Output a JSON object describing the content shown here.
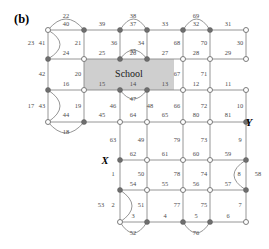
{
  "figure": {
    "panel_label": "(b)",
    "region_label": "School",
    "terminal_labels": [
      {
        "name": "X",
        "x": 105,
        "y": 160
      },
      {
        "name": "Y",
        "x": 249,
        "y": 122
      }
    ],
    "colors": {
      "edge": "#8a8a8a",
      "node_filled": "#6e6e6e",
      "node_hollow": "#ffffff",
      "school_fill": "#cfcfcf",
      "label_text": "#4a4a4a",
      "background": "#ffffff"
    },
    "school_region": {
      "x": 84,
      "y": 59,
      "width": 90,
      "height": 31
    }
  },
  "chart_data": {
    "type": "diagram",
    "title": "(b)",
    "nodes": [
      {
        "id": "n1",
        "x": 48,
        "y": 30,
        "style": "hollow"
      },
      {
        "id": "n2",
        "x": 84,
        "y": 30,
        "style": "filled"
      },
      {
        "id": "n3",
        "x": 120,
        "y": 30,
        "style": "filled"
      },
      {
        "id": "n4",
        "x": 147,
        "y": 30,
        "style": "filled"
      },
      {
        "id": "n5",
        "x": 183,
        "y": 30,
        "style": "filled"
      },
      {
        "id": "n6",
        "x": 210,
        "y": 30,
        "style": "filled"
      },
      {
        "id": "n7",
        "x": 246,
        "y": 30,
        "style": "hollow"
      },
      {
        "id": "n8",
        "x": 48,
        "y": 59,
        "style": "filled"
      },
      {
        "id": "n9",
        "x": 84,
        "y": 59,
        "style": "hollow"
      },
      {
        "id": "n10",
        "x": 120,
        "y": 59,
        "style": "filled"
      },
      {
        "id": "n11",
        "x": 147,
        "y": 59,
        "style": "filled"
      },
      {
        "id": "n12",
        "x": 183,
        "y": 59,
        "style": "hollow"
      },
      {
        "id": "n13",
        "x": 210,
        "y": 59,
        "style": "hollow"
      },
      {
        "id": "n14",
        "x": 246,
        "y": 59,
        "style": "hollow"
      },
      {
        "id": "n15",
        "x": 48,
        "y": 90,
        "style": "filled"
      },
      {
        "id": "n16",
        "x": 84,
        "y": 90,
        "style": "hollow"
      },
      {
        "id": "n17",
        "x": 120,
        "y": 90,
        "style": "filled"
      },
      {
        "id": "n18",
        "x": 147,
        "y": 90,
        "style": "filled"
      },
      {
        "id": "n19",
        "x": 183,
        "y": 90,
        "style": "hollow"
      },
      {
        "id": "n20",
        "x": 210,
        "y": 90,
        "style": "hollow"
      },
      {
        "id": "n21",
        "x": 246,
        "y": 90,
        "style": "hollow"
      },
      {
        "id": "n22",
        "x": 48,
        "y": 122,
        "style": "hollow"
      },
      {
        "id": "n23",
        "x": 84,
        "y": 122,
        "style": "filled"
      },
      {
        "id": "n24",
        "x": 120,
        "y": 122,
        "style": "hollow"
      },
      {
        "id": "n25",
        "x": 147,
        "y": 122,
        "style": "hollow"
      },
      {
        "id": "n26",
        "x": 183,
        "y": 122,
        "style": "hollow"
      },
      {
        "id": "n27",
        "x": 210,
        "y": 122,
        "style": "hollow"
      },
      {
        "id": "n28",
        "x": 246,
        "y": 122,
        "style": "filled"
      },
      {
        "id": "n29",
        "x": 120,
        "y": 160,
        "style": "filled"
      },
      {
        "id": "n30",
        "x": 147,
        "y": 160,
        "style": "hollow"
      },
      {
        "id": "n31",
        "x": 183,
        "y": 160,
        "style": "hollow"
      },
      {
        "id": "n32",
        "x": 210,
        "y": 160,
        "style": "hollow"
      },
      {
        "id": "n33",
        "x": 246,
        "y": 160,
        "style": "filled"
      },
      {
        "id": "n34",
        "x": 120,
        "y": 190,
        "style": "filled"
      },
      {
        "id": "n35",
        "x": 147,
        "y": 190,
        "style": "hollow"
      },
      {
        "id": "n36",
        "x": 183,
        "y": 190,
        "style": "hollow"
      },
      {
        "id": "n37",
        "x": 210,
        "y": 190,
        "style": "hollow"
      },
      {
        "id": "n38",
        "x": 246,
        "y": 190,
        "style": "filled"
      },
      {
        "id": "n39",
        "x": 120,
        "y": 222,
        "style": "hollow"
      },
      {
        "id": "n40",
        "x": 147,
        "y": 222,
        "style": "filled"
      },
      {
        "id": "n41",
        "x": 183,
        "y": 222,
        "style": "filled"
      },
      {
        "id": "n42",
        "x": 210,
        "y": 222,
        "style": "filled"
      },
      {
        "id": "n43",
        "x": 246,
        "y": 222,
        "style": "hollow"
      }
    ],
    "edges": [
      {
        "label": "22",
        "type": "arc",
        "from": "n1",
        "to": "n2",
        "lx": 66,
        "ly": 17,
        "bulge": -11
      },
      {
        "label": "40",
        "type": "line",
        "from": "n1",
        "to": "n2",
        "lx": 66,
        "ly": 25
      },
      {
        "label": "23",
        "type": "arc",
        "from": "n1",
        "to": "n8",
        "lx": 31,
        "ly": 44,
        "bulge": -12
      },
      {
        "label": "41",
        "type": "line",
        "from": "n1",
        "to": "n8",
        "lx": 42,
        "ly": 44
      },
      {
        "label": "21",
        "type": "line",
        "from": "n2",
        "to": "n9",
        "lx": 78,
        "ly": 44
      },
      {
        "label": "39",
        "type": "line",
        "from": "n2",
        "to": "n3",
        "lx": 102,
        "ly": 25
      },
      {
        "label": "36",
        "type": "line",
        "from": "n3",
        "to": "n10",
        "lx": 114,
        "ly": 44
      },
      {
        "label": "38",
        "type": "arc",
        "from": "n3",
        "to": "n4",
        "lx": 133,
        "ly": 17,
        "bulge": -11
      },
      {
        "label": "37",
        "type": "line",
        "from": "n3",
        "to": "n4",
        "lx": 133,
        "ly": 25
      },
      {
        "label": "34",
        "type": "line",
        "from": "n4",
        "to": "n11",
        "lx": 141,
        "ly": 44
      },
      {
        "label": "35",
        "type": "arc",
        "from": "n10",
        "to": "n11",
        "lx": 133,
        "ly": 52,
        "bulge": -9
      },
      {
        "label": "33",
        "type": "line",
        "from": "n4",
        "to": "n5",
        "lx": 165,
        "ly": 25
      },
      {
        "label": "69",
        "type": "arc",
        "from": "n5",
        "to": "n6",
        "lx": 196,
        "ly": 17,
        "bulge": -11
      },
      {
        "label": "32",
        "type": "line",
        "from": "n5",
        "to": "n6",
        "lx": 196,
        "ly": 25
      },
      {
        "label": "68",
        "type": "line",
        "from": "n5",
        "to": "n12",
        "lx": 177,
        "ly": 44
      },
      {
        "label": "70",
        "type": "line",
        "from": "n6",
        "to": "n13",
        "lx": 204,
        "ly": 44
      },
      {
        "label": "31",
        "type": "line",
        "from": "n6",
        "to": "n7",
        "lx": 228,
        "ly": 25
      },
      {
        "label": "30",
        "type": "line",
        "from": "n7",
        "to": "n14",
        "lx": 240,
        "ly": 44
      },
      {
        "label": "24",
        "type": "line",
        "from": "n8",
        "to": "n9",
        "lx": 66,
        "ly": 54
      },
      {
        "label": "42",
        "type": "line",
        "from": "n8",
        "to": "n15",
        "lx": 42,
        "ly": 75
      },
      {
        "label": "20",
        "type": "line",
        "from": "n9",
        "to": "n16",
        "lx": 78,
        "ly": 75
      },
      {
        "label": "25",
        "type": "line",
        "from": "n9",
        "to": "n10",
        "lx": 102,
        "ly": 54
      },
      {
        "label": "26",
        "type": "line",
        "from": "n10",
        "to": "n11",
        "lx": 133,
        "ly": 54
      },
      {
        "label": "27",
        "type": "line",
        "from": "n11",
        "to": "n12",
        "lx": 165,
        "ly": 54
      },
      {
        "label": "67",
        "type": "line",
        "from": "n12",
        "to": "n19",
        "lx": 177,
        "ly": 75
      },
      {
        "label": "28",
        "type": "line",
        "from": "n12",
        "to": "n13",
        "lx": 196,
        "ly": 54
      },
      {
        "label": "71",
        "type": "line",
        "from": "n13",
        "to": "n20",
        "lx": 204,
        "ly": 75
      },
      {
        "label": "29",
        "type": "line",
        "from": "n13",
        "to": "n14",
        "lx": 228,
        "ly": 54
      },
      {
        "label": "16",
        "type": "line",
        "from": "n15",
        "to": "n16",
        "lx": 66,
        "ly": 85
      },
      {
        "label": "17",
        "type": "arc",
        "from": "n15",
        "to": "n22",
        "lx": 31,
        "ly": 107,
        "bulge": -12
      },
      {
        "label": "43",
        "type": "line",
        "from": "n15",
        "to": "n22",
        "lx": 42,
        "ly": 107
      },
      {
        "label": "19",
        "type": "line",
        "from": "n16",
        "to": "n23",
        "lx": 78,
        "ly": 107
      },
      {
        "label": "15",
        "type": "line",
        "from": "n16",
        "to": "n17",
        "lx": 102,
        "ly": 85
      },
      {
        "label": "14",
        "type": "line",
        "from": "n17",
        "to": "n18",
        "lx": 133,
        "ly": 85
      },
      {
        "label": "47",
        "type": "arc",
        "from": "n17",
        "to": "n18",
        "lx": 133,
        "ly": 100,
        "bulge": 9
      },
      {
        "label": "46",
        "type": "line",
        "from": "n17",
        "to": "n24",
        "lx": 113,
        "ly": 107
      },
      {
        "label": "48",
        "type": "line",
        "from": "n18",
        "to": "n25",
        "lx": 150,
        "ly": 107
      },
      {
        "label": "13",
        "type": "line",
        "from": "n18",
        "to": "n19",
        "lx": 165,
        "ly": 85
      },
      {
        "label": "66",
        "type": "line",
        "from": "n19",
        "to": "n26",
        "lx": 177,
        "ly": 107
      },
      {
        "label": "12",
        "type": "line",
        "from": "n19",
        "to": "n20",
        "lx": 196,
        "ly": 85
      },
      {
        "label": "72",
        "type": "line",
        "from": "n20",
        "to": "n27",
        "lx": 204,
        "ly": 107
      },
      {
        "label": "11",
        "type": "line",
        "from": "n20",
        "to": "n21",
        "lx": 228,
        "ly": 85
      },
      {
        "label": "10",
        "type": "line",
        "from": "n21",
        "to": "n28",
        "lx": 240,
        "ly": 107
      },
      {
        "label": "44",
        "type": "line",
        "from": "n22",
        "to": "n23",
        "lx": 66,
        "ly": 116
      },
      {
        "label": "18",
        "type": "arc",
        "from": "n22",
        "to": "n23",
        "lx": 66,
        "ly": 133,
        "bulge": 11
      },
      {
        "label": "45",
        "type": "line",
        "from": "n23",
        "to": "n24",
        "lx": 102,
        "ly": 116
      },
      {
        "label": "63",
        "type": "line",
        "from": "n24",
        "to": "n29",
        "lx": 113,
        "ly": 141
      },
      {
        "label": "64",
        "type": "line",
        "from": "n24",
        "to": "n25",
        "lx": 133,
        "ly": 116
      },
      {
        "label": "49",
        "type": "line",
        "from": "n25",
        "to": "n30",
        "lx": 141,
        "ly": 141
      },
      {
        "label": "65",
        "type": "line",
        "from": "n25",
        "to": "n26",
        "lx": 165,
        "ly": 116
      },
      {
        "label": "79",
        "type": "line",
        "from": "n26",
        "to": "n31",
        "lx": 177,
        "ly": 141
      },
      {
        "label": "80",
        "type": "line",
        "from": "n26",
        "to": "n27",
        "lx": 196,
        "ly": 116
      },
      {
        "label": "73",
        "type": "line",
        "from": "n27",
        "to": "n32",
        "lx": 204,
        "ly": 141
      },
      {
        "label": "81",
        "type": "line",
        "from": "n27",
        "to": "n28",
        "lx": 228,
        "ly": 116
      },
      {
        "label": "9",
        "type": "line",
        "from": "n28",
        "to": "n33",
        "lx": 240,
        "ly": 141
      },
      {
        "label": "62",
        "type": "line",
        "from": "n29",
        "to": "n30",
        "lx": 133,
        "ly": 155
      },
      {
        "label": "1",
        "type": "line",
        "from": "n29",
        "to": "n34",
        "lx": 113,
        "ly": 175
      },
      {
        "label": "50",
        "type": "line",
        "from": "n30",
        "to": "n35",
        "lx": 141,
        "ly": 175
      },
      {
        "label": "61",
        "type": "line",
        "from": "n30",
        "to": "n31",
        "lx": 165,
        "ly": 155
      },
      {
        "label": "78",
        "type": "line",
        "from": "n31",
        "to": "n36",
        "lx": 177,
        "ly": 175
      },
      {
        "label": "60",
        "type": "line",
        "from": "n31",
        "to": "n32",
        "lx": 196,
        "ly": 155
      },
      {
        "label": "74",
        "type": "line",
        "from": "n32",
        "to": "n37",
        "lx": 204,
        "ly": 175
      },
      {
        "label": "59",
        "type": "line",
        "from": "n32",
        "to": "n33",
        "lx": 228,
        "ly": 155
      },
      {
        "label": "58",
        "type": "arc",
        "from": "n33",
        "to": "n38",
        "lx": 258,
        "ly": 175,
        "bulge": 12
      },
      {
        "label": "8",
        "type": "line",
        "from": "n33",
        "to": "n38",
        "lx": 239,
        "ly": 175
      },
      {
        "label": "54",
        "type": "line",
        "from": "n34",
        "to": "n35",
        "lx": 133,
        "ly": 185
      },
      {
        "label": "2",
        "type": "line",
        "from": "n34",
        "to": "n39",
        "lx": 113,
        "ly": 206
      },
      {
        "label": "53",
        "type": "arc",
        "from": "n34",
        "to": "n39",
        "lx": 101,
        "ly": 206,
        "bulge": -12
      },
      {
        "label": "51",
        "type": "line",
        "from": "n35",
        "to": "n40",
        "lx": 141,
        "ly": 206
      },
      {
        "label": "55",
        "type": "line",
        "from": "n35",
        "to": "n36",
        "lx": 165,
        "ly": 185
      },
      {
        "label": "77",
        "type": "line",
        "from": "n36",
        "to": "n41",
        "lx": 177,
        "ly": 206
      },
      {
        "label": "56",
        "type": "line",
        "from": "n36",
        "to": "n37",
        "lx": 196,
        "ly": 185
      },
      {
        "label": "75",
        "type": "line",
        "from": "n37",
        "to": "n42",
        "lx": 204,
        "ly": 206
      },
      {
        "label": "57",
        "type": "line",
        "from": "n37",
        "to": "n38",
        "lx": 228,
        "ly": 185
      },
      {
        "label": "7",
        "type": "line",
        "from": "n38",
        "to": "n43",
        "lx": 240,
        "ly": 206
      },
      {
        "label": "3",
        "type": "line",
        "from": "n39",
        "to": "n40",
        "lx": 133,
        "ly": 217
      },
      {
        "label": "52",
        "type": "arc",
        "from": "n39",
        "to": "n40",
        "lx": 133,
        "ly": 234,
        "bulge": 11
      },
      {
        "label": "4",
        "type": "line",
        "from": "n40",
        "to": "n41",
        "lx": 165,
        "ly": 217
      },
      {
        "label": "5",
        "type": "line",
        "from": "n41",
        "to": "n42",
        "lx": 196,
        "ly": 217
      },
      {
        "label": "76",
        "type": "arc",
        "from": "n41",
        "to": "n42",
        "lx": 196,
        "ly": 234,
        "bulge": 11
      },
      {
        "label": "6",
        "type": "line",
        "from": "n42",
        "to": "n43",
        "lx": 228,
        "ly": 217
      }
    ]
  }
}
